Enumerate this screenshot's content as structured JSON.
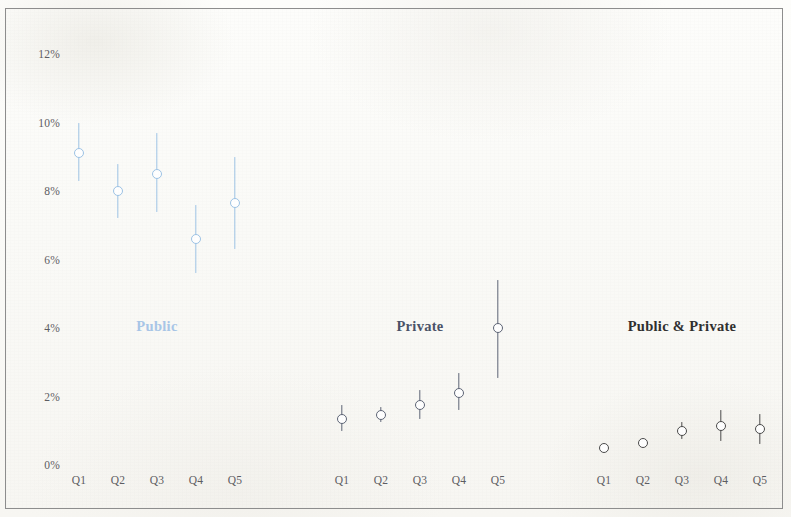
{
  "chart_data": {
    "type": "scatter",
    "title": "",
    "subtitle": "",
    "xlabel": "",
    "ylabel": "",
    "ylim": [
      0,
      12
    ],
    "grid": false,
    "legend_position": "inline-group-labels",
    "y_ticks": [
      "0%",
      "2%",
      "4%",
      "6%",
      "8%",
      "10%",
      "12%"
    ],
    "y_tick_values": [
      0,
      2,
      4,
      6,
      8,
      10,
      12
    ],
    "categories": [
      "Q1",
      "Q2",
      "Q3",
      "Q4",
      "Q5"
    ],
    "units": "percent",
    "marker_style": "open-circle-with-vertical-error-bar",
    "groups": [
      {
        "name": "Public",
        "label": "Public",
        "color": "#9dc3e6",
        "label_color": "#a8c6e8",
        "categories": [
          "Q1",
          "Q2",
          "Q3",
          "Q4",
          "Q5"
        ],
        "values": [
          9.1,
          8.0,
          8.5,
          6.6,
          7.65
        ],
        "err_low": [
          8.3,
          7.2,
          7.4,
          5.6,
          6.3
        ],
        "err_high": [
          10.0,
          8.8,
          9.7,
          7.6,
          9.0
        ]
      },
      {
        "name": "Private",
        "label": "Private",
        "color": "#5d6475",
        "label_color": "#4a5268",
        "categories": [
          "Q1",
          "Q2",
          "Q3",
          "Q4",
          "Q5"
        ],
        "values": [
          1.35,
          1.45,
          1.75,
          2.1,
          4.0
        ],
        "err_low": [
          1.0,
          1.25,
          1.35,
          1.6,
          2.55
        ],
        "err_high": [
          1.75,
          1.7,
          2.2,
          2.7,
          5.4
        ]
      },
      {
        "name": "Public & Private",
        "label": "Public & Private",
        "color": "#4a4a4a",
        "label_color": "#2f2f2f",
        "categories": [
          "Q1",
          "Q2",
          "Q3",
          "Q4",
          "Q5"
        ],
        "values": [
          0.5,
          0.65,
          1.0,
          1.15,
          1.05
        ],
        "err_low": [
          0.5,
          0.55,
          0.75,
          0.7,
          0.6
        ],
        "err_high": [
          0.5,
          0.75,
          1.25,
          1.6,
          1.5
        ]
      }
    ]
  },
  "axis": {
    "y_labels": [
      "12%",
      "10%",
      "8%",
      "6%",
      "4%",
      "2%",
      "0%"
    ]
  },
  "frame": {
    "border_color": "#8d8d8d",
    "background_color": "#fbfbf9"
  }
}
